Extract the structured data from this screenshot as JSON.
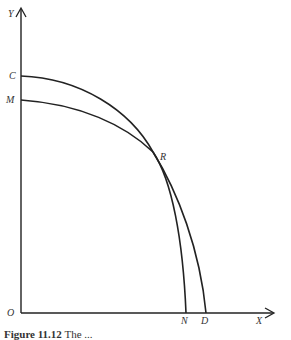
{
  "diagram": {
    "axes": {
      "y_label": "Y",
      "x_label": "X",
      "origin_label": "O"
    },
    "curves": [
      {
        "name": "C-to-D",
        "start_label": "C",
        "end_label": "D"
      },
      {
        "name": "M-to-N",
        "start_label": "M",
        "end_label": "N"
      }
    ],
    "intersection_label": "R"
  },
  "caption": {
    "prefix": "Figure 11.12",
    "text": "The ..."
  }
}
